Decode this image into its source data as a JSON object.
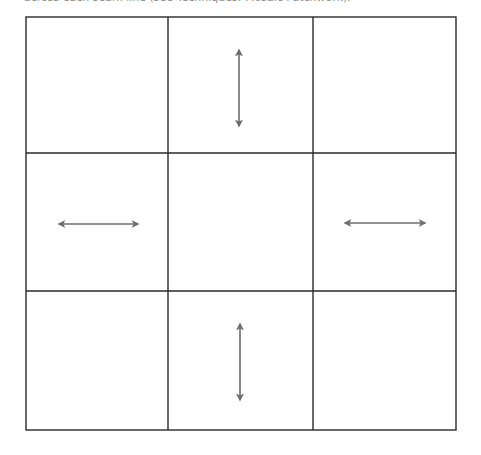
{
  "caption": {
    "text": "across each seam line (see Techniques: Mosaic Patchwork)."
  },
  "diagram": {
    "type": "3x3 patchwork grid with pressing-direction arrows",
    "grid": {
      "rows": 3,
      "cols": 3,
      "x_lines": [
        26,
        168,
        313,
        456
      ],
      "y_lines": [
        17,
        153,
        291,
        430
      ],
      "line_color": "#2a2a2a"
    },
    "arrow_color": "#6e6e6e",
    "arrows": [
      {
        "cell": "row1-col2",
        "direction": "vertical",
        "x1": 239,
        "y1": 48,
        "x2": 239,
        "y2": 128
      },
      {
        "cell": "row2-col1",
        "direction": "horizontal",
        "x1": 57,
        "y1": 224,
        "x2": 140,
        "y2": 224
      },
      {
        "cell": "row2-col3",
        "direction": "horizontal",
        "x1": 343,
        "y1": 223,
        "x2": 427,
        "y2": 223
      },
      {
        "cell": "row3-col2",
        "direction": "vertical",
        "x1": 240,
        "y1": 322,
        "x2": 240,
        "y2": 402
      }
    ]
  }
}
